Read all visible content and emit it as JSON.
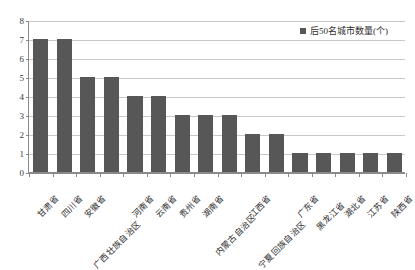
{
  "chart_data": {
    "type": "bar",
    "title": "",
    "subtitle": "",
    "xlabel": "",
    "ylabel": "",
    "ylim": [
      0,
      8
    ],
    "ytick_step": 1,
    "yticks": [
      "8",
      "7",
      "6",
      "5",
      "4",
      "3",
      "2",
      "1",
      "0"
    ],
    "grid": true,
    "legend_position": "top-right",
    "orientation": "vertical",
    "categories": [
      "甘肃省",
      "四川省",
      "安徽省",
      "广西壮族自治区",
      "河南省",
      "云南省",
      "贵州省",
      "湖南省",
      "内蒙古自治区",
      "江西省",
      "宁夏回族自治区",
      "广东省",
      "黑龙江省",
      "湖北省",
      "江苏省",
      "陕西省"
    ],
    "series": [
      {
        "name": "后50名城市数量(个)",
        "values": [
          7,
          7,
          5,
          5,
          4,
          4,
          3,
          3,
          3,
          2,
          2,
          1,
          1,
          1,
          1,
          1
        ],
        "color": "#575757"
      }
    ]
  },
  "legend": {
    "entries": [
      {
        "label": "后50名城市数量(个)",
        "color": "#575757",
        "marker": "square-marker"
      }
    ]
  },
  "colors": {
    "bar": "#575757",
    "gridline": "#c8c8c8",
    "axis": "#8a8a8a",
    "text": "#2e2e2e",
    "background": "#ffffff"
  }
}
